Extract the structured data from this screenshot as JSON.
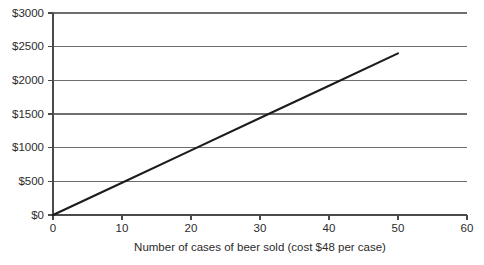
{
  "chart_data": {
    "type": "line",
    "title": "",
    "subtitle": "",
    "xlabel": "Number of cases of beer sold (cost $48 per case)",
    "ylabel": "",
    "xlim": [
      0,
      60
    ],
    "ylim": [
      0,
      3000
    ],
    "grid": "horizontal",
    "legend": "none",
    "x_ticks": [
      0,
      10,
      20,
      30,
      40,
      50,
      60
    ],
    "x_tick_labels": [
      "0",
      "10",
      "20",
      "30",
      "40",
      "50",
      "60"
    ],
    "y_ticks": [
      0,
      500,
      1000,
      1500,
      2000,
      2500,
      3000
    ],
    "y_tick_labels": [
      "$0",
      "$500",
      "$1000",
      "$1500",
      "$2000",
      "$2500",
      "$3000"
    ],
    "series": [
      {
        "name": "Total cost",
        "color": "#1c1c1c",
        "slope_per_case": 48,
        "x": [
          0,
          10,
          20,
          30,
          40,
          50
        ],
        "values": [
          0,
          480,
          960,
          1440,
          1920,
          2400
        ]
      }
    ],
    "annotations": []
  },
  "plot_geometry": {
    "left": 53,
    "right": 467,
    "top": 13,
    "bottom": 215
  },
  "colors": {
    "background": "#ffffff",
    "gridline": "#6e6e6e",
    "axis": "#4a4a4a",
    "line": "#1c1c1c",
    "text": "#2b2b2b"
  }
}
